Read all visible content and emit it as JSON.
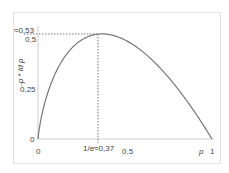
{
  "chart_data": {
    "type": "line",
    "title": "",
    "xlabel": "p",
    "ylabel": "-p * ld p",
    "xlim": [
      0,
      1
    ],
    "ylim": [
      0,
      0.53
    ],
    "x_ticks": [
      "0",
      "1/e≈0.37",
      "0.5",
      "1"
    ],
    "y_ticks": [
      "0",
      "0.25",
      "0.5",
      "≈0.53"
    ],
    "x_tick_labels_display": [
      "0",
      "1/e≈0,37",
      "0,5",
      "1"
    ],
    "y_tick_labels_display": [
      "0",
      "0,25",
      "0,5",
      "≈0,53"
    ],
    "series": [
      {
        "name": "-p ld p",
        "function": "-p*log2(p)",
        "x": [
          0,
          0.02,
          0.05,
          0.1,
          0.15,
          0.2,
          0.25,
          0.3,
          0.3679,
          0.4,
          0.5,
          0.6,
          0.7,
          0.8,
          0.9,
          1.0
        ],
        "values": [
          0,
          0.113,
          0.216,
          0.332,
          0.411,
          0.464,
          0.5,
          0.521,
          0.531,
          0.529,
          0.5,
          0.442,
          0.36,
          0.258,
          0.137,
          0
        ]
      }
    ],
    "annotations": [
      {
        "type": "dotted-line",
        "from": [
          0,
          0.531
        ],
        "to": [
          0.3679,
          0.531
        ]
      },
      {
        "type": "dotted-line",
        "from": [
          0.3679,
          0
        ],
        "to": [
          0.3679,
          0.531
        ]
      }
    ],
    "grid": false,
    "legend": "none"
  },
  "labels": {
    "y_axis": "-p * ld p",
    "x_axis": "p",
    "max_value": "≈0,53",
    "y_half": "0,5",
    "y_quarter": "0,25",
    "y_zero": "0",
    "x_zero": "0",
    "x_max_at": "1/e≈0,37",
    "x_half": "0,5",
    "x_one": "1"
  }
}
